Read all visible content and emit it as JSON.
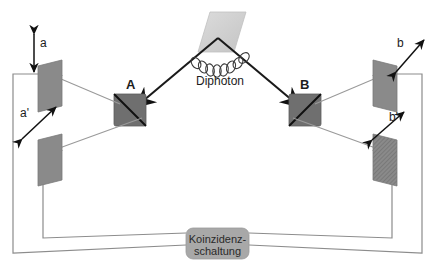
{
  "figure": {
    "type": "optics-schematic",
    "title": "",
    "source": {
      "label": "Diphoton",
      "element_name": "diphoton-source-crystal"
    },
    "beamsplitters": [
      {
        "id": "A",
        "label": "A",
        "x": 131,
        "y": 111
      },
      {
        "id": "B",
        "label": "B",
        "x": 305,
        "y": 111
      }
    ],
    "detectors": [
      {
        "id": "a",
        "label": "a",
        "side": "left",
        "position": "upper",
        "arrow": "vertical"
      },
      {
        "id": "a'",
        "label": "a'",
        "side": "left",
        "position": "lower",
        "arrow": "diagonal-up-right"
      },
      {
        "id": "b",
        "label": "b",
        "side": "right",
        "position": "upper",
        "arrow": "diagonal-up-right"
      },
      {
        "id": "b'",
        "label": "b'",
        "side": "right",
        "position": "lower",
        "arrow": "diagonal-up-right"
      }
    ],
    "coincidence_unit": {
      "line1": "Koinzidenz-",
      "line2": "schaltung",
      "text": "Koinzidenz-\nschaltung"
    },
    "colors": {
      "detector_fill": "#8a8a8a",
      "beamsplitter_fill": "#6f6f6f",
      "source_fill": "#d3d3d3",
      "beam_line": "#1a1a1a",
      "signal_line": "#9a9a9a",
      "wire": "#8c8c8c",
      "coincidence_fill": "#a8a8a8",
      "text": "#1c1c1c"
    }
  }
}
